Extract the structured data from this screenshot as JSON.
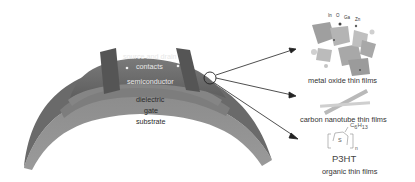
{
  "figure": {
    "device": {
      "layers": {
        "contacts": "source and drain\ncontacts",
        "contacts_line1": "source and drain",
        "contacts_line2": "contacts",
        "semiconductor": "semiconductor",
        "dielectric": "dielectric",
        "gate": "gate",
        "substrate": "substrate"
      }
    },
    "materials": [
      {
        "name": "metal oxide thin films",
        "atoms": [
          "In",
          "O",
          "Ga",
          "Zn"
        ]
      },
      {
        "name": "carbon nanotube thin films"
      },
      {
        "name": "organic thin films",
        "molecule": "P3HT",
        "side_chain": "C6H13",
        "side_chain_c": "C",
        "side_chain_c_sub": "6",
        "side_chain_h": "H",
        "side_chain_h_sub": "13",
        "ring_atom": "S",
        "repeat": "n"
      }
    ],
    "colors": {
      "device_top": "#6e6e6e",
      "device_side": "#8a8a8a",
      "contact": "#5a5a5a",
      "arrow": "#222222"
    }
  }
}
